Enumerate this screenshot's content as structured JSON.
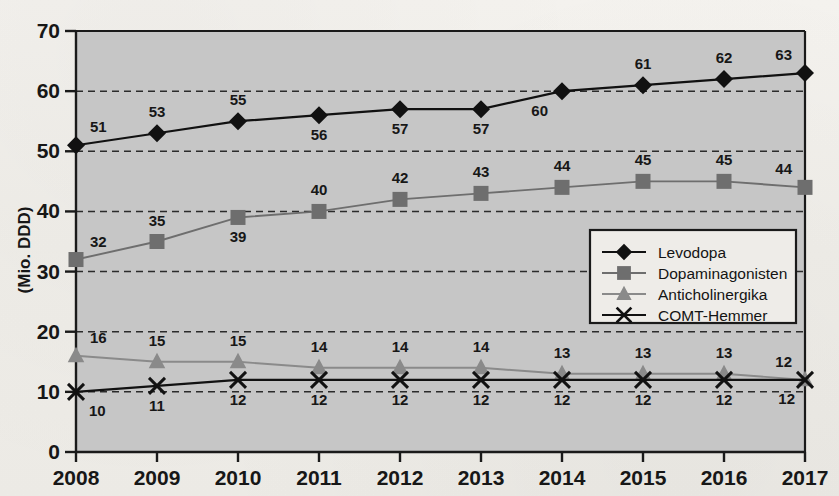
{
  "chart_data": {
    "type": "line",
    "title": "",
    "xlabel": "",
    "ylabel": "(Mio. DDD)",
    "categories": [
      "2008",
      "2009",
      "2010",
      "2011",
      "2012",
      "2013",
      "2014",
      "2015",
      "2016",
      "2017"
    ],
    "xlim": [
      2008,
      2017
    ],
    "ylim": [
      0,
      70
    ],
    "yticks": [
      0,
      10,
      20,
      30,
      40,
      50,
      60,
      70
    ],
    "grid": "horizontal-dashed",
    "legend_position": "inside-right-middle",
    "series": [
      {
        "name": "Levodopa",
        "marker": "diamond",
        "color": "#111111",
        "line_color": "#111111",
        "values": [
          51,
          53,
          55,
          56,
          57,
          57,
          60,
          61,
          62,
          63
        ],
        "label_positions": [
          "above-left",
          "above",
          "above",
          "below",
          "below",
          "below",
          "below-right",
          "above",
          "above",
          "above-left"
        ]
      },
      {
        "name": "Dopaminagonisten",
        "marker": "square",
        "color": "#6e6e6e",
        "line_color": "#6e6e6e",
        "values": [
          32,
          35,
          39,
          40,
          42,
          43,
          44,
          45,
          45,
          44
        ],
        "label_positions": [
          "above-left",
          "above",
          "below",
          "above",
          "above",
          "above",
          "above",
          "above",
          "above",
          "above-left"
        ]
      },
      {
        "name": "Anticholinergika",
        "marker": "triangle",
        "color": "#8a8a8a",
        "line_color": "#8a8a8a",
        "values": [
          16,
          15,
          15,
          14,
          14,
          14,
          13,
          13,
          13,
          12
        ],
        "label_positions": [
          "above-left",
          "above",
          "above",
          "above",
          "above",
          "above",
          "above",
          "above",
          "above",
          "above-left"
        ]
      },
      {
        "name": "COMT-Hemmer",
        "marker": "cross",
        "color": "#111111",
        "line_color": "#111111",
        "values": [
          10,
          11,
          12,
          12,
          12,
          12,
          12,
          12,
          12,
          12
        ],
        "label_positions": [
          "below-left",
          "below",
          "below",
          "below",
          "below",
          "below",
          "below",
          "below",
          "below",
          "below-left"
        ]
      }
    ],
    "colors": {
      "plot_background": "#c6c6c6",
      "page_background": "#f2f0ec",
      "axis": "#1a1a1a",
      "gridline": "#2b2b2b"
    }
  }
}
